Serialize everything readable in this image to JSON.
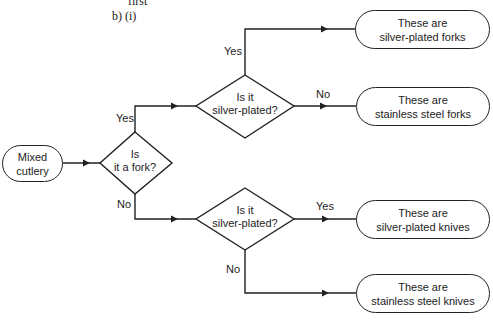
{
  "header": {
    "top_fragment": "first",
    "part_label": "b) (i)"
  },
  "nodes": {
    "start": {
      "line1": "Mixed",
      "line2": "cutlery"
    },
    "decision_fork": {
      "line1": "Is",
      "line2": "it a fork?"
    },
    "decision_silver_upper": {
      "line1": "Is it",
      "line2": "silver-plated?"
    },
    "decision_silver_lower": {
      "line1": "Is it",
      "line2": "silver-plated?"
    },
    "out_silver_forks": {
      "line1": "These are",
      "line2": "silver-plated forks"
    },
    "out_stainless_forks": {
      "line1": "These are",
      "line2": "stainless steel forks"
    },
    "out_silver_knives": {
      "line1": "These are",
      "line2": "silver-plated knives"
    },
    "out_stainless_knives": {
      "line1": "These are",
      "line2": "stainless steel knives"
    }
  },
  "edges": {
    "fork_yes": "Yes",
    "fork_no": "No",
    "upper_yes": "Yes",
    "upper_no": "No",
    "lower_yes": "Yes",
    "lower_no": "No"
  }
}
